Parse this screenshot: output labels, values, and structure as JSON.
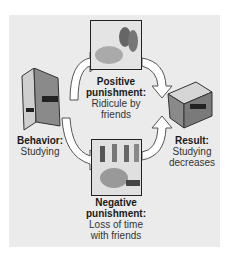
{
  "diagram": {
    "behavior": {
      "title": "Behavior:",
      "text": "Studying"
    },
    "positive": {
      "title": "Positive punishment:",
      "line1": "Ridicule by",
      "line2": "friends"
    },
    "negative": {
      "title": "Negative punishment:",
      "line1": "Loss of time",
      "line2": "with friends"
    },
    "result": {
      "title": "Result:",
      "line1": "Studying",
      "line2": "decreases"
    }
  },
  "colors": {
    "panel": "#ebebeb",
    "arrow": "#ffffff",
    "arrow_stroke": "#555555",
    "book": "#8a8a8a"
  }
}
